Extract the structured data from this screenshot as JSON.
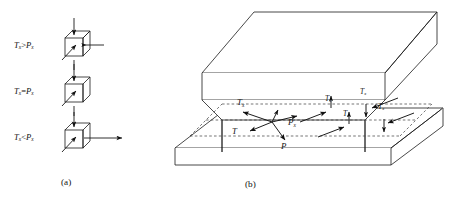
{
  "figure": {
    "line_color": "#1a1a1a",
    "dashed_color": "#3a3a3a",
    "fill_color": "#ffffff",
    "panels": [
      {
        "id": "a",
        "caption": "(a)",
        "description": "Three unit cubes showing tangential vs. normal force component relations",
        "cases": [
          {
            "label_T": "T",
            "label_T_sub": "x",
            "relation": ">",
            "label_P": "P",
            "label_P_sub": "x",
            "text": "Tx>Px",
            "has_horizontal_arrow": true,
            "horizontal_arrow_length": "short"
          },
          {
            "label_T": "T",
            "label_T_sub": "x",
            "relation": "=",
            "label_P": "P",
            "label_P_sub": "x",
            "text": "Tx=Px",
            "has_horizontal_arrow": false,
            "horizontal_arrow_length": "none"
          },
          {
            "label_T": "T",
            "label_T_sub": "x",
            "relation": "<",
            "label_P": "P",
            "label_P_sub": "x",
            "text": "Tx<Px",
            "has_horizontal_arrow": true,
            "horizontal_arrow_length": "long"
          }
        ]
      },
      {
        "id": "b",
        "caption": "(b)",
        "description": "Isometric view of upper beam seated on lower plate with resolved force vectors",
        "vectors": [
          {
            "name": "Tx",
            "base": "T",
            "sub": "x"
          },
          {
            "name": "T",
            "base": "T",
            "sub": ""
          },
          {
            "name": "Px",
            "base": "P",
            "sub": "x"
          },
          {
            "name": "P",
            "base": "P",
            "sub": ""
          }
        ],
        "flank_vectors": [
          {
            "name": "Tx",
            "base": "T",
            "sub": "x"
          },
          {
            "name": "Tx",
            "base": "T",
            "sub": "x"
          },
          {
            "name": "Tx",
            "base": "T",
            "sub": "x"
          },
          {
            "name": "Tx",
            "base": "T",
            "sub": "x"
          }
        ]
      }
    ]
  }
}
